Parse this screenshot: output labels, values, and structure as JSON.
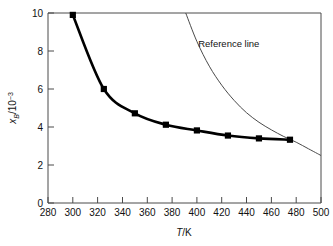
{
  "chart_data": {
    "type": "line",
    "title": "",
    "xlabel": "T/K",
    "xlabel_parts": {
      "italic": "T",
      "rest": "/K"
    },
    "ylabel": "x_B/10^-3",
    "ylabel_parts": {
      "italic": "x",
      "subscript": "B",
      "mid": "/10",
      "superscript": "−3"
    },
    "xlim": [
      280,
      500
    ],
    "ylim": [
      0,
      10
    ],
    "xticks": [
      280,
      300,
      320,
      340,
      360,
      380,
      400,
      420,
      440,
      460,
      480,
      500
    ],
    "xticklabels": [
      "280",
      "300",
      "320",
      "340",
      "360",
      "380",
      "400",
      "420",
      "440",
      "460",
      "480",
      "500"
    ],
    "yticks": [
      0,
      2,
      4,
      6,
      8,
      10
    ],
    "yticklabels": [
      "0",
      "2",
      "4",
      "6",
      "8",
      "10"
    ],
    "xminorticks": [
      290,
      310,
      330,
      350,
      370,
      390,
      410,
      430,
      450,
      470,
      490
    ],
    "grid": false,
    "legend": false,
    "series": [
      {
        "name": "measured-solubility",
        "style": "markers-with-thick-line",
        "marker": "square",
        "x": [
          300,
          325,
          350,
          375,
          400,
          425,
          450,
          475
        ],
        "y": [
          9.9,
          6.0,
          4.72,
          4.12,
          3.82,
          3.55,
          3.4,
          3.33
        ]
      },
      {
        "name": "Reference line",
        "style": "thin-line-no-markers",
        "x": [
          391,
          400,
          410,
          420,
          430,
          440,
          450,
          460,
          470,
          480,
          490,
          500
        ],
        "y": [
          10.0,
          8.5,
          7.2,
          6.2,
          5.4,
          4.75,
          4.25,
          3.85,
          3.5,
          3.2,
          2.85,
          2.5
        ]
      }
    ],
    "annotations": [
      {
        "text": "Reference line",
        "x": 401,
        "y": 8.2
      }
    ]
  },
  "axes": {
    "x_title": "T/K",
    "y_title": "x_B/10^-3"
  }
}
